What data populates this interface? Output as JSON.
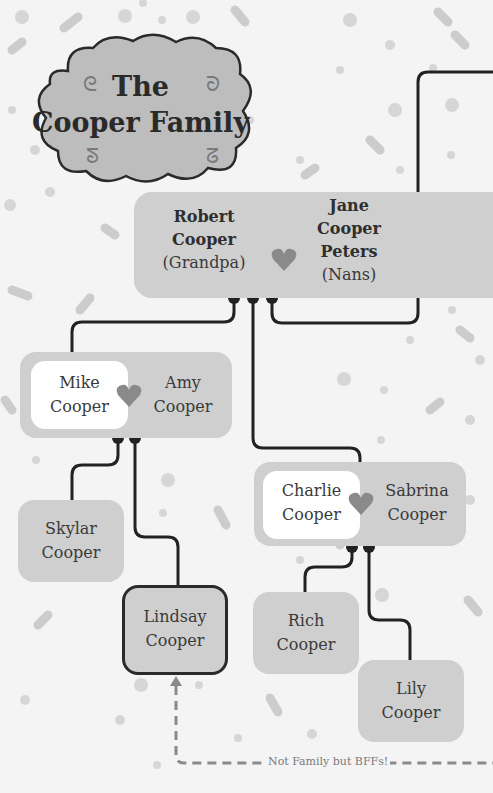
{
  "title": {
    "line1": "The",
    "line2": "Cooper Family"
  },
  "couples": {
    "grandparents": {
      "left": {
        "first": "Robert",
        "last": "Cooper",
        "nickname": "(Grandpa)"
      },
      "right": {
        "first": "Jane",
        "middle": "Cooper",
        "last": "Peters",
        "nickname": "(Nans)"
      }
    },
    "mike_amy": {
      "left": {
        "first": "Mike",
        "last": "Cooper"
      },
      "right": {
        "first": "Amy",
        "last": "Cooper"
      }
    },
    "charlie_sabrina": {
      "left": {
        "first": "Charlie",
        "last": "Cooper"
      },
      "right": {
        "first": "Sabrina",
        "last": "Cooper"
      }
    }
  },
  "children": {
    "skylar": {
      "first": "Skylar",
      "last": "Cooper"
    },
    "lindsay": {
      "first": "Lindsay",
      "last": "Cooper"
    },
    "rich": {
      "first": "Rich",
      "last": "Cooper"
    },
    "lily": {
      "first": "Lily",
      "last": "Cooper"
    }
  },
  "annotation": {
    "bff_label": "Not Family but BFFs!"
  },
  "colors": {
    "background": "#f4f4f4",
    "box": "#cfcfcf",
    "heart": "#8a8a8a",
    "line": "#222222",
    "cloud": "#bdbdbd"
  }
}
